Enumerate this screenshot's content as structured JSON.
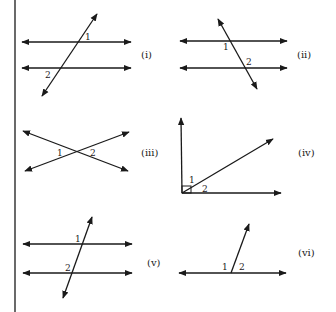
{
  "figures": [
    {
      "id": "i",
      "label": "(i)",
      "type": "parallel-lines-transversal",
      "angle_labels": [
        "1",
        "2"
      ]
    },
    {
      "id": "ii",
      "label": "(ii)",
      "type": "parallel-lines-transversal",
      "angle_labels": [
        "1",
        "2"
      ]
    },
    {
      "id": "iii",
      "label": "(iii)",
      "type": "intersecting-lines",
      "angle_labels": [
        "1",
        "2"
      ]
    },
    {
      "id": "iv",
      "label": "(iv)",
      "type": "right-angle-split",
      "angle_labels": [
        "1",
        "2"
      ]
    },
    {
      "id": "v",
      "label": "(v)",
      "type": "parallel-lines-transversal",
      "angle_labels": [
        "1",
        "2"
      ]
    },
    {
      "id": "vi",
      "label": "(vi)",
      "type": "linear-pair",
      "angle_labels": [
        "1",
        "2"
      ]
    }
  ]
}
